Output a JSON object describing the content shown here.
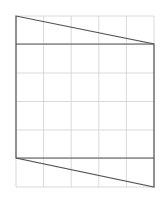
{
  "diagram": {
    "width": 163,
    "height": 203,
    "grid": {
      "x0": 16,
      "y0": 16,
      "x1": 154,
      "y1": 187,
      "columns": 5,
      "rows": 6,
      "color": "#d9d9d9"
    },
    "shape": {
      "stroke": "#555555",
      "stroke_width": 1.2,
      "outline": [
        [
          16,
          16
        ],
        [
          154,
          44
        ],
        [
          154,
          187
        ],
        [
          16,
          158
        ]
      ],
      "segments": [
        [
          [
            16,
            44
          ],
          [
            154,
            44
          ]
        ],
        [
          [
            16,
            158
          ],
          [
            154,
            158
          ]
        ]
      ]
    }
  }
}
